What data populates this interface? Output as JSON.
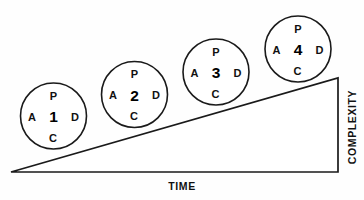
{
  "figure": {
    "title_cropped": "",
    "background_color": "#fefefe",
    "stroke_color": "#1a1a1a",
    "width": 364,
    "height": 200
  },
  "axes": {
    "x_label": "TIME",
    "y_label": "COMPLEXITY"
  },
  "wedge": {
    "name": "complexity-ramp",
    "apex": [
      11,
      172
    ],
    "top_right": [
      338,
      78
    ],
    "bottom_right": [
      338,
      172
    ]
  },
  "cycles": [
    {
      "number": "1",
      "cx": 53.5,
      "cy": 116,
      "r": 33,
      "top": "P",
      "left": "A",
      "right": "D",
      "bottom": "C"
    },
    {
      "number": "2",
      "cx": 134.5,
      "cy": 94.5,
      "r": 33,
      "top": "P",
      "left": "A",
      "right": "D",
      "bottom": "C"
    },
    {
      "number": "3",
      "cx": 216,
      "cy": 72,
      "r": 33,
      "top": "P",
      "left": "A",
      "right": "D",
      "bottom": "C"
    },
    {
      "number": "4",
      "cx": 298,
      "cy": 49,
      "r": 33,
      "top": "P",
      "left": "A",
      "right": "D",
      "bottom": "C"
    }
  ],
  "chart_data": {
    "type": "scatter",
    "title": "",
    "xlabel": "TIME",
    "ylabel": "COMPLEXITY",
    "categories": [
      "1",
      "2",
      "3",
      "4"
    ],
    "values": [
      1,
      2,
      3,
      4
    ],
    "annotations": [
      "P",
      "D",
      "C",
      "A"
    ],
    "grid": false,
    "legend": "none"
  }
}
